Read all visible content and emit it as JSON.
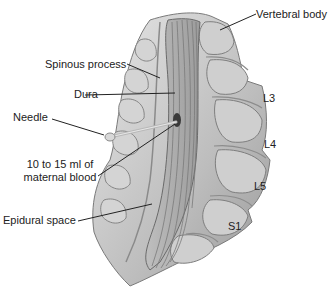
{
  "diagram": {
    "type": "anatomical-illustration",
    "colors": {
      "bone_light": "#d9d9d9",
      "bone_mid": "#b5b5b5",
      "bone_dark": "#8a8a8a",
      "outline": "#6e6e6e",
      "leader_line": "#222222",
      "blood": "#3a3a3a",
      "background": "#ffffff"
    },
    "labels": {
      "vertebral_body": "Vertebral body",
      "spinous_process": "Spinous process",
      "dura": "Dura",
      "needle": "Needle",
      "blood_line1": "10 to 15 ml of",
      "blood_line2": "maternal blood",
      "epidural_space": "Epidural space",
      "l3": "L3",
      "l4": "L4",
      "l5": "L5",
      "s1": "S1"
    }
  }
}
